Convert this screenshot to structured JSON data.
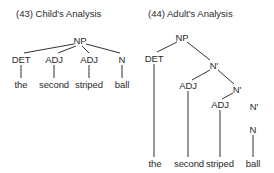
{
  "trees": [
    {
      "id": "43",
      "title": "(43)  Child's Analysis",
      "nodes": {
        "np": "NP",
        "det": "DET",
        "adj1": "ADJ",
        "adj2": "ADJ",
        "n": "N"
      },
      "words": [
        "the",
        "second",
        "striped",
        "ball"
      ]
    },
    {
      "id": "44",
      "title": "(44)  Adult's Analysis",
      "nodes": {
        "np": "NP",
        "det": "DET",
        "nbar1": "N'",
        "adj1": "ADJ",
        "nbar2": "N'",
        "adj2": "ADJ",
        "nbar3": "N'",
        "n": "N"
      },
      "words": [
        "the",
        "second",
        "striped",
        "ball"
      ]
    }
  ],
  "colors": {
    "line": "#333333",
    "text": "#2a2a2a",
    "background": "#ffffff"
  }
}
